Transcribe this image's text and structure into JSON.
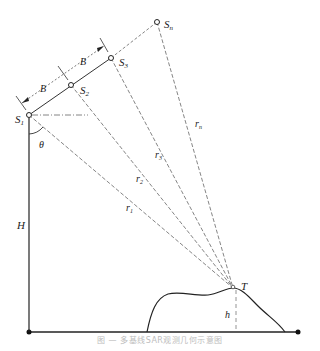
{
  "diagram": {
    "nodes": {
      "S1": {
        "label": "S",
        "sub": "1",
        "x": 29,
        "y": 115
      },
      "S2": {
        "label": "S",
        "sub": "2",
        "x": 71,
        "y": 85
      },
      "S3": {
        "label": "S",
        "sub": "3",
        "x": 111,
        "y": 58
      },
      "Sn": {
        "label": "S",
        "sub": "n",
        "x": 157,
        "y": 22
      },
      "T": {
        "label": "T",
        "x": 233,
        "y": 288
      }
    },
    "baseline_labels": [
      "B",
      "B"
    ],
    "ranges": [
      "r1",
      "r2",
      "r3",
      "rn"
    ],
    "range_labels": {
      "r1": {
        "main": "r",
        "sub": "1"
      },
      "r2": {
        "main": "r",
        "sub": "2"
      },
      "r3": {
        "main": "r",
        "sub": "3"
      },
      "rn": {
        "main": "r",
        "sub": "n"
      }
    },
    "angle_label": "θ",
    "height_platform_label": "H",
    "height_target_label": "h",
    "caption": "图 — 多基线SAR观测几何示意图"
  }
}
